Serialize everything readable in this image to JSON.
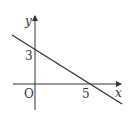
{
  "diagram": {
    "type": "coordinate-plane-line",
    "axes": {
      "x_label": "x",
      "y_label": "y",
      "origin_label": "O"
    },
    "line": {
      "x_intercept": 5,
      "y_intercept": 3,
      "equation": "3x + 5y = 15"
    },
    "tick_labels": {
      "x": "5",
      "y": "3"
    },
    "colors": {
      "stroke": "#333333",
      "background": "#ffffff"
    }
  }
}
